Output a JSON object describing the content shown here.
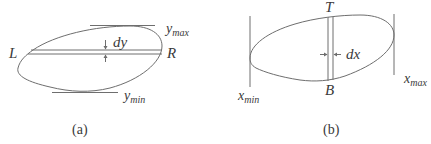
{
  "panel_a": {
    "caption": "(a)",
    "left_label": "L",
    "right_label": "R",
    "strip_label": "dy",
    "ymax_label": {
      "base": "y",
      "sub": "max"
    },
    "ymin_label": {
      "base": "y",
      "sub": "min"
    }
  },
  "panel_b": {
    "caption": "(b)",
    "top_label": "T",
    "bottom_label": "B",
    "strip_label": "dx",
    "xmin_label": {
      "base": "x",
      "sub": "min"
    },
    "xmax_label": {
      "base": "x",
      "sub": "max"
    }
  },
  "colors": {
    "stroke": "#6e6e6e",
    "text": "#3a3a3a",
    "background": "#ffffff"
  }
}
